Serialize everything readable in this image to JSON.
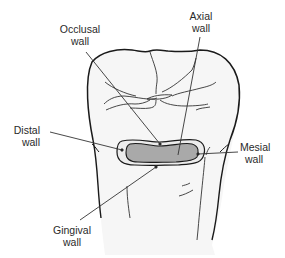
{
  "figure": {
    "colors": {
      "outline": "#1a1a1a",
      "tooth_fill": "#f7f7f7",
      "cavity_outer_fill": "#ececec",
      "cavity_axial_fill": "#a9a9a9",
      "leader": "#333333"
    },
    "labels": [
      {
        "id": "occlusal",
        "line1": "Occlusal",
        "line2": "wall"
      },
      {
        "id": "axial",
        "line1": "Axial",
        "line2": "wall"
      },
      {
        "id": "distal",
        "line1": "Distal",
        "line2": "wall"
      },
      {
        "id": "mesial",
        "line1": "Mesial",
        "line2": "wall"
      },
      {
        "id": "gingival",
        "line1": "Gingival",
        "line2": "wall"
      }
    ]
  }
}
